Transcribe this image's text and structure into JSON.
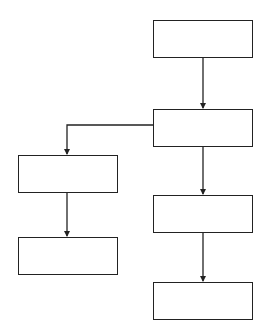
{
  "diagram": {
    "type": "flowchart",
    "stroke_color": "#222222",
    "background_color": "#ffffff",
    "nodes": [
      {
        "id": "n1",
        "label": "",
        "x": 153,
        "y": 20,
        "w": 100,
        "h": 38
      },
      {
        "id": "n2",
        "label": "",
        "x": 153,
        "y": 109,
        "w": 100,
        "h": 38
      },
      {
        "id": "n3",
        "label": "",
        "x": 18,
        "y": 155,
        "w": 100,
        "h": 38
      },
      {
        "id": "n4",
        "label": "",
        "x": 18,
        "y": 237,
        "w": 100,
        "h": 38
      },
      {
        "id": "n5",
        "label": "",
        "x": 153,
        "y": 195,
        "w": 100,
        "h": 38
      },
      {
        "id": "n6",
        "label": "",
        "x": 153,
        "y": 282,
        "w": 100,
        "h": 38
      }
    ],
    "edges": [
      {
        "from": "n1",
        "to": "n2"
      },
      {
        "from": "n2",
        "to": "n3"
      },
      {
        "from": "n2",
        "to": "n5"
      },
      {
        "from": "n3",
        "to": "n4"
      },
      {
        "from": "n5",
        "to": "n6"
      }
    ]
  }
}
